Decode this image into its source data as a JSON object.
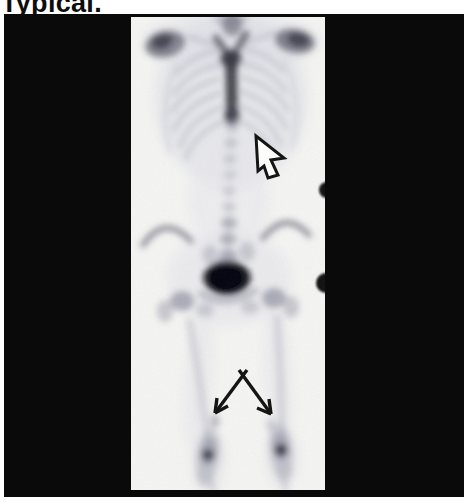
{
  "page": {
    "title": "Typical.",
    "note": "title text is cropped at the top edge of the image"
  },
  "figure": {
    "kind": "anterior whole-body bone scintigraphy film (shoulders to knees)",
    "colors": {
      "page_white": "#ffffff",
      "panel_black": "#0a0a0a",
      "film_white": "#f6f6f4",
      "hotspot_black": "#0e0e14",
      "annotation_black": "#151515",
      "text_black": "#0d0d0d"
    },
    "annotations": [
      {
        "name": "open-outline-arrow",
        "direction": "up-left",
        "target_region": "lower sternum / thoracic spine uptake"
      },
      {
        "name": "double-line-arrow",
        "direction": "down-left and down-right",
        "target_region": "distal femora above the knees"
      }
    ],
    "visible_features": [
      "shoulders",
      "rib cage",
      "sternum uptake column",
      "spine",
      "iliac crests",
      "bladder activity hotspot",
      "hips",
      "femoral shafts",
      "knees"
    ],
    "artifacts": [
      "two black dots on right film edge"
    ]
  }
}
